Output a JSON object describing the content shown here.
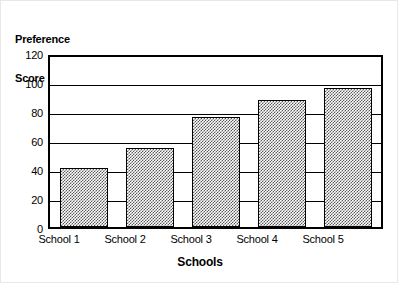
{
  "chart_data": {
    "type": "bar",
    "title": "",
    "xlabel": "Schools",
    "ylabel": "Preference Score",
    "ylabel_line1": "Preference",
    "ylabel_line2": "Score",
    "categories": [
      "School 1",
      "School 2",
      "School 3",
      "School 4",
      "School 5"
    ],
    "values": [
      42,
      56,
      78,
      90,
      98
    ],
    "ylim": [
      0,
      120
    ],
    "yticks": [
      0,
      20,
      40,
      60,
      80,
      100,
      120
    ],
    "ytick_labels": [
      "0",
      "20",
      "40",
      "60",
      "80",
      "100",
      "120"
    ],
    "grid": true,
    "grid_orientation": "horizontal",
    "legend": false,
    "legend_position": "none",
    "bar_fill": "#5a5a5a",
    "bar_fill_style": "checkerboard-dither",
    "bar_edge_color": "#000000",
    "frame_color": "#000000",
    "background": "#ffffff"
  }
}
